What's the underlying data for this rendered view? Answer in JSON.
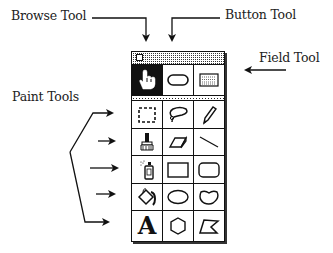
{
  "labels": {
    "browse_tool": "Browse Tool",
    "button_tool": "Button Tool",
    "field_tool": "Field Tool",
    "paint_tools": "Paint Tools"
  },
  "palette": {
    "top_row": [
      {
        "name": "browse",
        "icon": "hand-pointer-icon",
        "selected": true
      },
      {
        "name": "button",
        "icon": "rounded-rect-button-icon",
        "selected": false
      },
      {
        "name": "field",
        "icon": "text-field-icon",
        "selected": false
      }
    ],
    "paint_rows": [
      [
        "select-rect-icon",
        "lasso-icon",
        "pencil-icon"
      ],
      [
        "brush-icon",
        "eraser-icon",
        "line-icon"
      ],
      [
        "spray-can-icon",
        "rectangle-icon",
        "rounded-rectangle-icon"
      ],
      [
        "bucket-icon",
        "oval-icon",
        "curve-icon"
      ],
      [
        "text-icon",
        "polygon-icon",
        "irregular-polygon-icon"
      ]
    ],
    "text_tool_glyph": "A"
  },
  "colors": {
    "ink": "#111111",
    "background": "#ffffff"
  }
}
